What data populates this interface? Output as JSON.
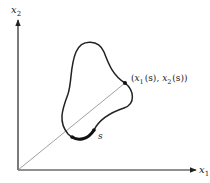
{
  "diagram": {
    "type": "parametric-curve",
    "axes": {
      "horizontal": {
        "label": "x",
        "subscript": "1"
      },
      "vertical": {
        "label": "x",
        "subscript": "2"
      }
    },
    "point_label": {
      "open": "(",
      "x1": "x",
      "x1_sub": "1",
      "x1_arg": "(s)",
      "sep": ", ",
      "x2": "x",
      "x2_sub": "2",
      "x2_arg": "(s)",
      "close": ")"
    },
    "arc_label": "s",
    "colors": {
      "ink": "#222222",
      "thin_line": "#888888",
      "background": "#ffffff"
    }
  }
}
